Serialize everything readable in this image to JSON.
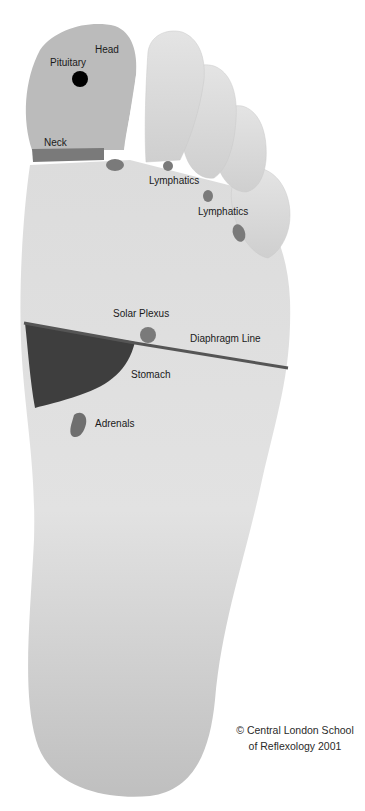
{
  "diagram": {
    "type": "foot-reflexology-map",
    "colors": {
      "background": "#ffffff",
      "foot": "#d6d6d6",
      "foot_shadow": "#bdbdbd",
      "head_zone": "#b9b9b9",
      "marker": "#7a7a7a",
      "stomach": "#3e3e3e",
      "pituitary": "#000000",
      "diaphragm_line": "#555555"
    },
    "labels": {
      "head": "Head",
      "pituitary": "Pituitary",
      "neck": "Neck",
      "lymphatics_1": "Lymphatics",
      "lymphatics_2": "Lymphatics",
      "solar_plexus": "Solar Plexus",
      "diaphragm_line": "Diaphragm Line",
      "stomach": "Stomach",
      "adrenals": "Adrenals"
    },
    "copyright": {
      "line1": "© Central London School",
      "line2": "of Reflexology 2001"
    }
  }
}
